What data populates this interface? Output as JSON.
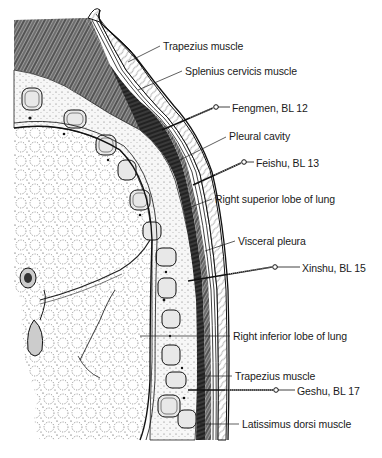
{
  "diagram": {
    "type": "anatomical-cross-section",
    "labels": [
      {
        "id": "trapezius-top",
        "text": "Trapezius muscle",
        "x": 163,
        "y": 40,
        "line_from": [
          160,
          46
        ],
        "line_to": [
          128,
          62
        ]
      },
      {
        "id": "splenius",
        "text": "Splenius cervicis muscle",
        "x": 185,
        "y": 65,
        "line_from": [
          182,
          71
        ],
        "line_to": [
          138,
          90
        ]
      },
      {
        "id": "fengmen",
        "text": "Fengmen, BL 12",
        "x": 232,
        "y": 103,
        "needle": true
      },
      {
        "id": "pleural-cavity",
        "text": "Pleural cavity",
        "x": 228,
        "y": 130,
        "line_from": [
          226,
          137
        ],
        "line_to": [
          180,
          160
        ]
      },
      {
        "id": "feishu",
        "text": "Feishu, BL 13",
        "x": 256,
        "y": 158,
        "needle": true
      },
      {
        "id": "right-superior-lobe",
        "text": "Right superior lobe of lung",
        "x": 215,
        "y": 193,
        "line_from": [
          212,
          199
        ],
        "line_to": [
          183,
          210
        ]
      },
      {
        "id": "visceral-pleura",
        "text": "Visceral pleura",
        "x": 238,
        "y": 235,
        "line_from": [
          235,
          241
        ],
        "line_to": [
          205,
          251
        ]
      },
      {
        "id": "xinshu",
        "text": "Xinshu, BL 15",
        "x": 302,
        "y": 262,
        "needle": true
      },
      {
        "id": "right-inferior-lobe",
        "text": "Right inferior lobe of lung",
        "x": 233,
        "y": 330,
        "line_from": [
          230,
          336
        ],
        "line_to": [
          140,
          336
        ]
      },
      {
        "id": "trapezius-bottom",
        "text": "Trapezius muscle",
        "x": 235,
        "y": 370,
        "line_from": [
          232,
          376
        ],
        "line_to": [
          198,
          376
        ]
      },
      {
        "id": "geshu",
        "text": "Geshu, BL 17",
        "x": 297,
        "y": 385,
        "needle": true
      },
      {
        "id": "latissimus",
        "text": "Latissimus dorsi muscle",
        "x": 242,
        "y": 418,
        "line_from": [
          239,
          424
        ],
        "line_to": [
          200,
          424
        ]
      }
    ],
    "needles": [
      {
        "id": "fengmen",
        "acupoint": "BL 12",
        "name": "Fengmen",
        "head": [
          216,
          107
        ],
        "tip": [
          162,
          130
        ],
        "label_line_to": [
          230,
          107
        ]
      },
      {
        "id": "feishu",
        "acupoint": "BL 13",
        "name": "Feishu",
        "head": [
          244,
          162
        ],
        "tip": [
          193,
          185
        ],
        "label_line_to": [
          254,
          162
        ]
      },
      {
        "id": "xinshu",
        "acupoint": "BL 15",
        "name": "Xinshu",
        "head": [
          275,
          267
        ],
        "tip": [
          188,
          281
        ],
        "label_line_to": [
          300,
          267
        ]
      },
      {
        "id": "geshu",
        "acupoint": "BL 17",
        "name": "Geshu",
        "head": [
          276,
          390
        ],
        "tip": [
          188,
          390
        ],
        "label_line_to": [
          295,
          390
        ]
      }
    ],
    "colors": {
      "ink": "#1a1a1a",
      "background": "#ffffff"
    }
  }
}
